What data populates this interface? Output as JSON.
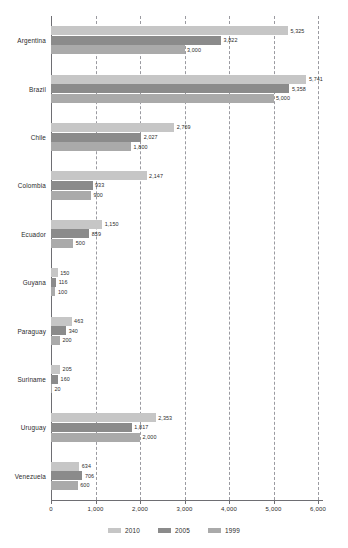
{
  "chart_data": {
    "type": "bar",
    "orientation": "horizontal",
    "title": "",
    "subtitle": "",
    "xlabel": "",
    "ylabel": "",
    "xlim": [
      0,
      6000
    ],
    "grid": true,
    "grid_axis": "x",
    "legend_position": "bottom-center",
    "xticks": [
      0,
      1000,
      2000,
      3000,
      4000,
      5000,
      6000
    ],
    "xtick_labels": [
      "0",
      "1,000",
      "2,000",
      "3,000",
      "4,000",
      "5,000",
      "6,000"
    ],
    "categories": [
      "Argentina",
      "Brazil",
      "Chile",
      "Colombia",
      "Ecuador",
      "Guyana",
      "Paraguay",
      "Suriname",
      "Uruguay",
      "Venezuela"
    ],
    "series": [
      {
        "name": "2010",
        "color": "#c6c6c6",
        "values": [
          5325,
          5741,
          2769,
          2147,
          1150,
          150,
          463,
          205,
          2353,
          634
        ],
        "labels": [
          "5,325",
          "5,741",
          "2,769",
          "2,147",
          "1,150",
          "150",
          "463",
          "205",
          "2,353",
          "634"
        ]
      },
      {
        "name": "2005",
        "color": "#8b8b8b",
        "values": [
          3822,
          5358,
          2027,
          933,
          859,
          116,
          340,
          160,
          1817,
          706
        ],
        "labels": [
          "3,822",
          "5,358",
          "2,027",
          "933",
          "859",
          "116",
          "340",
          "160",
          "1,817",
          "706"
        ]
      },
      {
        "name": "1999",
        "color": "#aaaaaa",
        "values": [
          3000,
          5000,
          1800,
          900,
          500,
          100,
          200,
          20,
          2000,
          600
        ],
        "labels": [
          "3,000",
          "5,000",
          "1,800",
          "900",
          "500",
          "100",
          "200",
          "20",
          "2,000",
          "600"
        ]
      }
    ]
  },
  "legend": {
    "items": [
      {
        "label": "2010",
        "color": "#c6c6c6"
      },
      {
        "label": "2005",
        "color": "#8b8b8b"
      },
      {
        "label": "1999",
        "color": "#aaaaaa"
      }
    ]
  }
}
